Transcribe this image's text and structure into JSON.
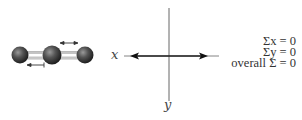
{
  "diagram": {
    "molecule": {
      "atoms": [
        {
          "cx": 20,
          "cy": 55,
          "r": 8.5
        },
        {
          "cx": 52,
          "cy": 55,
          "r": 9.5
        },
        {
          "cx": 85,
          "cy": 55,
          "r": 8.5
        }
      ],
      "displacement_arrows": [
        {
          "from": 60,
          "to": 78,
          "y": 43,
          "direction": "double"
        },
        {
          "from": 27,
          "to": 44,
          "y": 65,
          "direction": "double"
        }
      ]
    },
    "axes": {
      "x_label": "x",
      "y_label": "y"
    },
    "equations": {
      "sum_x": "Σx = 0",
      "sum_y": "Σy = 0",
      "overall": "overall Σ = 0"
    },
    "colors": {
      "atom": "#3a3a3a",
      "bond": "#bbbbbb",
      "line": "#333333"
    }
  }
}
